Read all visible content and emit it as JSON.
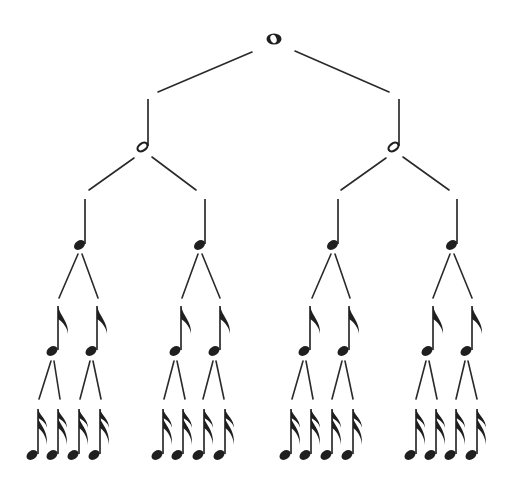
{
  "diagram": {
    "title": "Note value subdivision tree",
    "type": "binary-tree",
    "colors": {
      "background": "#ffffff",
      "ink": "#1f1f1f",
      "line": "#2a2a2a"
    },
    "levels": [
      {
        "name": "whole",
        "label": "Whole note",
        "count": 1,
        "icon": "whole-note-icon"
      },
      {
        "name": "half",
        "label": "Half note",
        "count": 2,
        "icon": "half-note-icon"
      },
      {
        "name": "quarter",
        "label": "Quarter note",
        "count": 4,
        "icon": "quarter-note-icon"
      },
      {
        "name": "eighth",
        "label": "Eighth note",
        "count": 8,
        "icon": "eighth-note-icon"
      },
      {
        "name": "sixteenth",
        "label": "Sixteenth note",
        "count": 16,
        "icon": "sixteenth-note-icon"
      }
    ]
  }
}
